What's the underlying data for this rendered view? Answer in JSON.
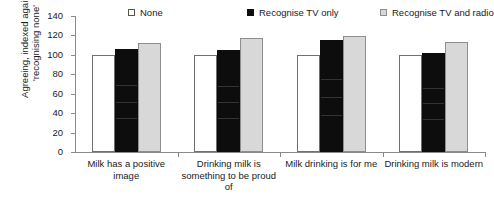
{
  "chart_data": {
    "type": "bar",
    "title": "",
    "xlabel": "",
    "ylabel": "Agreeing, indexed against 'recognising none'",
    "ylim": [
      0,
      140
    ],
    "yticks": [
      0,
      20,
      40,
      60,
      80,
      100,
      120,
      140
    ],
    "grid": false,
    "legend_position": "top",
    "categories": [
      "Milk has a positive image",
      "Drinking milk is something to be proud of",
      "Milk drinking is for me",
      "Drinking milk is modern"
    ],
    "series": [
      {
        "name": "None",
        "color": "#ffffff",
        "edge_color": "#6f6f6f",
        "values": [
          100,
          100,
          100,
          100
        ]
      },
      {
        "name": "Recognise TV only",
        "color": "#0d0d0d",
        "edge_color": "#0d0d0d",
        "values": [
          106,
          105,
          115,
          102
        ]
      },
      {
        "name": "Recognise TV and radio",
        "color": "#d8d8d8",
        "edge_color": "#8e8e8e",
        "values": [
          112,
          117,
          119,
          113
        ]
      }
    ]
  },
  "legend": {
    "items": [
      {
        "label": "None",
        "swatch": "#ffffff"
      },
      {
        "label": "Recognise TV only",
        "swatch": "#0d0d0d"
      },
      {
        "label": "Recognise TV and radio",
        "swatch": "#d8d8d8"
      }
    ]
  },
  "axis": {
    "y_label": "Agreeing, indexed against 'recognising none'",
    "y_tick_labels": [
      "0",
      "20",
      "40",
      "60",
      "80",
      "100",
      "120",
      "140"
    ]
  },
  "categories_display": [
    "Milk has a positive image",
    "Drinking milk is something to be proud of",
    "Milk drinking is for me",
    "Drinking milk is modern"
  ]
}
